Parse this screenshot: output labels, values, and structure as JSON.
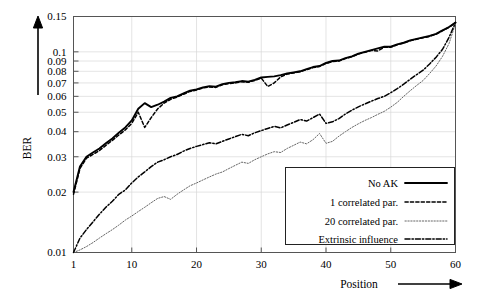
{
  "chart_data": {
    "type": "line",
    "title": "",
    "xlabel": "Position",
    "ylabel": "BER",
    "xlim": [
      1,
      60
    ],
    "ylim": [
      0.01,
      0.15
    ],
    "yscale": "log",
    "grid": true,
    "legend_position": "bottom-right",
    "xticks": [
      1,
      10,
      20,
      30,
      40,
      50,
      60
    ],
    "xtick_labels": [
      "1",
      "10",
      "20",
      "30",
      "40",
      "50",
      "60"
    ],
    "yticks": [
      0.01,
      0.02,
      0.03,
      0.04,
      0.05,
      0.06,
      0.07,
      0.08,
      0.09,
      0.1,
      0.15
    ],
    "ytick_labels": [
      "0.01",
      "0.02",
      "0.03",
      "0.04",
      "0.05",
      "0.06",
      "0.07",
      "0.08",
      "0.09",
      "0.1",
      "0.15"
    ],
    "x": [
      1,
      2,
      3,
      4,
      5,
      6,
      7,
      8,
      9,
      10,
      11,
      12,
      13,
      14,
      15,
      16,
      17,
      18,
      19,
      20,
      21,
      22,
      23,
      24,
      25,
      26,
      27,
      28,
      29,
      30,
      31,
      32,
      33,
      34,
      35,
      36,
      37,
      38,
      39,
      40,
      41,
      42,
      43,
      44,
      45,
      46,
      47,
      48,
      49,
      50,
      51,
      52,
      53,
      54,
      55,
      56,
      57,
      58,
      59,
      60
    ],
    "series": [
      {
        "name": "No AK",
        "style": "solid",
        "values": [
          0.02,
          0.0268,
          0.03,
          0.0315,
          0.033,
          0.035,
          0.037,
          0.0395,
          0.042,
          0.0455,
          0.052,
          0.0555,
          0.053,
          0.0545,
          0.0565,
          0.059,
          0.06,
          0.062,
          0.064,
          0.065,
          0.0665,
          0.0675,
          0.067,
          0.069,
          0.07,
          0.0705,
          0.0715,
          0.071,
          0.0725,
          0.0745,
          0.075,
          0.0755,
          0.0765,
          0.078,
          0.079,
          0.08,
          0.082,
          0.084,
          0.085,
          0.088,
          0.09,
          0.0905,
          0.093,
          0.095,
          0.098,
          0.1,
          0.102,
          0.104,
          0.106,
          0.106,
          0.109,
          0.111,
          0.114,
          0.116,
          0.118,
          0.12,
          0.123,
          0.128,
          0.133,
          0.14
        ]
      },
      {
        "name": "1 correlated par.",
        "style": "dashed",
        "values": [
          0.0195,
          0.0262,
          0.0295,
          0.0308,
          0.0322,
          0.0342,
          0.0362,
          0.0385,
          0.0408,
          0.044,
          0.05,
          0.042,
          0.047,
          0.052,
          0.0555,
          0.058,
          0.0595,
          0.0615,
          0.0635,
          0.0645,
          0.066,
          0.0668,
          0.0665,
          0.0685,
          0.0695,
          0.07,
          0.071,
          0.0705,
          0.072,
          0.074,
          0.0672,
          0.07,
          0.075,
          0.0775,
          0.0785,
          0.0795,
          0.0815,
          0.0835,
          0.0845,
          0.0875,
          0.0895,
          0.09,
          0.0925,
          0.0945,
          0.0975,
          0.0995,
          0.1015,
          0.101,
          0.1055,
          0.1055,
          0.1085,
          0.1105,
          0.1135,
          0.1155,
          0.1175,
          0.1195,
          0.1225,
          0.1275,
          0.1325,
          0.1395
        ]
      },
      {
        "name": "20 correlated par.",
        "style": "dotted",
        "values": [
          0.01,
          0.0103,
          0.0107,
          0.0112,
          0.0118,
          0.0124,
          0.013,
          0.0137,
          0.0145,
          0.0152,
          0.016,
          0.0168,
          0.0177,
          0.0186,
          0.019,
          0.0184,
          0.0195,
          0.0205,
          0.0215,
          0.0222,
          0.023,
          0.0238,
          0.0246,
          0.0252,
          0.0262,
          0.0272,
          0.0282,
          0.0278,
          0.029,
          0.03,
          0.031,
          0.0318,
          0.0315,
          0.033,
          0.0342,
          0.0355,
          0.0348,
          0.0365,
          0.0392,
          0.035,
          0.0358,
          0.038,
          0.04,
          0.042,
          0.0438,
          0.0455,
          0.047,
          0.0488,
          0.0505,
          0.053,
          0.056,
          0.06,
          0.064,
          0.068,
          0.072,
          0.078,
          0.085,
          0.095,
          0.11,
          0.138
        ]
      },
      {
        "name": "Extrinsic influence",
        "style": "dashdot",
        "values": [
          0.01,
          0.0118,
          0.013,
          0.0142,
          0.0155,
          0.0168,
          0.018,
          0.0195,
          0.0205,
          0.0222,
          0.0238,
          0.0252,
          0.0268,
          0.0282,
          0.029,
          0.03,
          0.0308,
          0.032,
          0.033,
          0.0338,
          0.0345,
          0.0352,
          0.0348,
          0.0358,
          0.0368,
          0.0378,
          0.0388,
          0.0382,
          0.0395,
          0.0405,
          0.0415,
          0.0425,
          0.0418,
          0.0432,
          0.0445,
          0.046,
          0.0452,
          0.047,
          0.049,
          0.044,
          0.0448,
          0.0465,
          0.049,
          0.0512,
          0.0532,
          0.055,
          0.0568,
          0.0585,
          0.06,
          0.0625,
          0.0655,
          0.069,
          0.073,
          0.077,
          0.081,
          0.087,
          0.094,
          0.103,
          0.118,
          0.14
        ]
      }
    ]
  },
  "axes": {
    "y_axis_arrow": "up-arrow-icon",
    "x_axis_arrow": "right-arrow-icon"
  },
  "legend": {
    "entries": [
      {
        "label": "No AK",
        "style": "solid"
      },
      {
        "label": "1 correlated par.",
        "style": "dashed"
      },
      {
        "label": "20 correlated par.",
        "style": "dotted"
      },
      {
        "label": "Extrinsic influence",
        "style": "dashdot"
      }
    ]
  }
}
